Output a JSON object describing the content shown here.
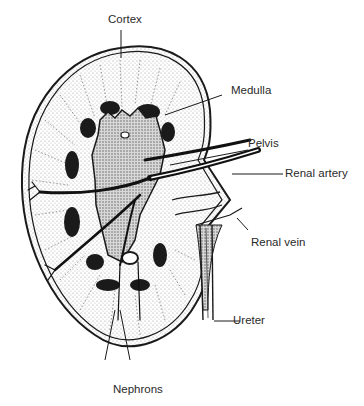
{
  "diagram": {
    "labels": {
      "cortex": "Cortex",
      "medulla": "Medulla",
      "pelvis": "Pelvis",
      "renal_artery": "Renal artery",
      "renal_vein": "Renal vein",
      "ureter": "Ureter",
      "nephrons": "Nephrons"
    },
    "colors": {
      "ink": "#1a1a1a",
      "stipple": "#c8c8c8",
      "background": "#ffffff"
    }
  }
}
